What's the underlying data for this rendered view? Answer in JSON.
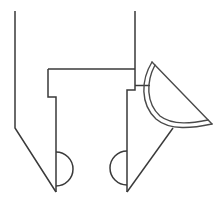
{
  "figure": {
    "background_color": "#ffffff",
    "stroke_color": "#3a3a3a",
    "stroke_width": 1.5,
    "canvas": {
      "width": 217,
      "height": 210
    }
  },
  "shapes": {
    "left_arm": {
      "name": "left-arm-outline",
      "path": "M 15 11 L 15 128 L 56 192"
    },
    "left_jaw": {
      "name": "left-jaw-outline",
      "path": "M 48 69 L 48 97 L 56 97 L 56 192"
    },
    "left_semicircle": {
      "name": "left-semicircle",
      "path": "M 56 152 A 17 17 0 0 1 56 186",
      "center_x": 56,
      "center_y": 169,
      "radius": 17,
      "bulge": "right"
    },
    "cross_bar_top": {
      "name": "cross-bar-top-edge",
      "path": "M 48 69 L 135 69"
    },
    "right_arm": {
      "name": "right-arm-outline",
      "path": "M 135 11 L 135 90 L 127 90 L 127 192"
    },
    "right_stub": {
      "name": "right-connector-stub",
      "path": "M 135 85.5 L 150 85.5"
    },
    "right_semicircle": {
      "name": "right-semicircle",
      "path": "M 127 151 A 17 17 0 0 0 127 185",
      "center_x": 127,
      "center_y": 168,
      "radius": 17,
      "bulge": "left"
    },
    "pointer_diagonal": {
      "name": "pointer-diagonal",
      "path": "M 127 192 L 173 128"
    },
    "crescent_outer": {
      "name": "crescent-outer-arc",
      "path": "M 152 62 C 141 80, 140 104, 156 119 C 170 131, 193 128, 212 124"
    },
    "crescent_chord": {
      "name": "crescent-straight-edge",
      "path": "M 152 62 L 212 124"
    },
    "crescent_inner": {
      "name": "crescent-inner-arc",
      "path": "M 155 65 C 146 82, 146 103, 160 116 C 173 126, 193 123, 208 120"
    }
  }
}
